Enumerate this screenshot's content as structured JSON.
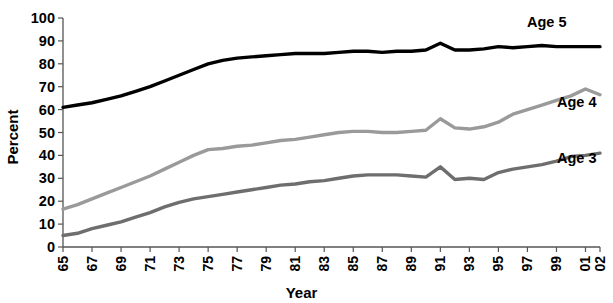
{
  "chart_data": {
    "type": "line",
    "title": "",
    "xlabel": "Year",
    "ylabel": "Percent",
    "ylim": [
      0,
      100
    ],
    "ytick_values": [
      0,
      10,
      20,
      30,
      40,
      50,
      60,
      70,
      80,
      90,
      100
    ],
    "ytick_labels": [
      "0",
      "10",
      "20",
      "30",
      "40",
      "50",
      "60",
      "70",
      "80",
      "90",
      "100"
    ],
    "grid": false,
    "legend_position": "inline-right",
    "xlim": [
      1965,
      2002
    ],
    "x": [
      1965,
      1966,
      1967,
      1968,
      1969,
      1970,
      1971,
      1972,
      1973,
      1974,
      1975,
      1976,
      1977,
      1978,
      1979,
      1980,
      1981,
      1982,
      1983,
      1984,
      1985,
      1986,
      1987,
      1988,
      1989,
      1990,
      1991,
      1992,
      1993,
      1994,
      1995,
      1996,
      1997,
      1998,
      1999,
      2000,
      2001,
      2002
    ],
    "xtick_values": [
      1965,
      1967,
      1969,
      1971,
      1973,
      1975,
      1977,
      1979,
      1981,
      1983,
      1985,
      1987,
      1989,
      1991,
      1993,
      1995,
      1997,
      1999,
      2001,
      2002
    ],
    "xtick_labels": [
      "65",
      "67",
      "69",
      "71",
      "73",
      "75",
      "77",
      "79",
      "81",
      "83",
      "85",
      "87",
      "89",
      "91",
      "93",
      "95",
      "97",
      "99",
      "01",
      "02"
    ],
    "series": [
      {
        "name": "Age 5",
        "color": "#000000",
        "stroke_width": 3.4,
        "label": "Age 5",
        "values": [
          61,
          62,
          63,
          64.5,
          66,
          68,
          70,
          72.5,
          75,
          77.5,
          80,
          81.5,
          82.5,
          83,
          83.5,
          84,
          84.5,
          84.5,
          84.5,
          85,
          85.5,
          85.5,
          85,
          85.5,
          85.5,
          86,
          89,
          86,
          86,
          86.5,
          87.5,
          87,
          87.5,
          88,
          87.5,
          87.5,
          87.5,
          87.5
        ]
      },
      {
        "name": "Age 4",
        "color": "#9a9a9a",
        "stroke_width": 3.4,
        "label": "Age 4",
        "values": [
          16.5,
          18.5,
          21,
          23.5,
          26,
          28.5,
          31,
          34,
          37,
          40,
          42.5,
          43,
          44,
          44.5,
          45.5,
          46.5,
          47,
          48,
          49,
          50,
          50.5,
          50.5,
          50,
          50,
          50.5,
          51,
          56,
          52,
          51.5,
          52.5,
          54.5,
          58,
          60,
          62,
          64,
          66,
          69,
          66.5
        ]
      },
      {
        "name": "Age 3",
        "color": "#6e6e6e",
        "stroke_width": 3.4,
        "label": "Age 3",
        "values": [
          5,
          6,
          8,
          9.5,
          11,
          13,
          15,
          17.5,
          19.5,
          21,
          22,
          23,
          24,
          25,
          26,
          27,
          27.5,
          28.5,
          29,
          30,
          31,
          31.5,
          31.5,
          31.5,
          31,
          30.5,
          35,
          29.5,
          30,
          29.5,
          32.5,
          34,
          35,
          36,
          37.5,
          39.5,
          40,
          41
        ]
      }
    ]
  }
}
